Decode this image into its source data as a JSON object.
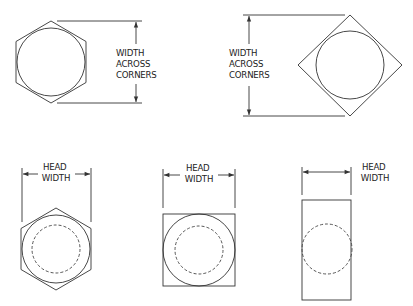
{
  "diagram": {
    "top_left": {
      "shape": "hexagon-flat-sides-vertical",
      "label_lines": [
        "WIDTH",
        "ACROSS",
        "CORNERS"
      ]
    },
    "top_right": {
      "shape": "square-rotated-45",
      "label_lines": [
        "WIDTH",
        "ACROSS",
        "CORNERS"
      ]
    },
    "bottom_left": {
      "shape": "hexagon-with-washer",
      "label_lines": [
        "HEAD",
        "WIDTH"
      ]
    },
    "bottom_center": {
      "shape": "square-with-washer",
      "label_lines": [
        "HEAD",
        "WIDTH"
      ]
    },
    "bottom_right": {
      "shape": "rectangle-with-dashed-circle",
      "label_lines": [
        "HEAD",
        "WIDTH"
      ]
    },
    "colors": {
      "line": "#333333",
      "background": "#ffffff"
    }
  }
}
